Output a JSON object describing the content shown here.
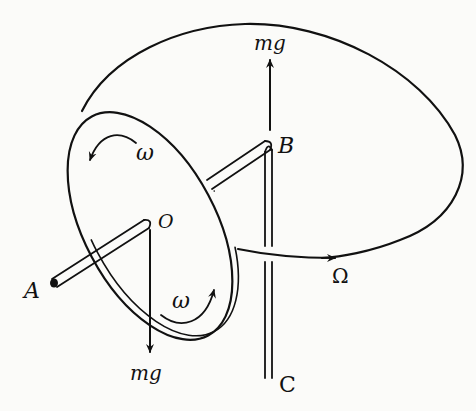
{
  "figure": {
    "labels": {
      "point_A": "A",
      "point_O": "O",
      "point_B": "B",
      "point_C": "C",
      "force_up": "mg",
      "force_down": "mg",
      "spin_top": "ω",
      "spin_bottom": "ω",
      "precession": "Ω"
    },
    "colors": {
      "ink": "#111111",
      "paper": "#fbfbf9"
    }
  }
}
